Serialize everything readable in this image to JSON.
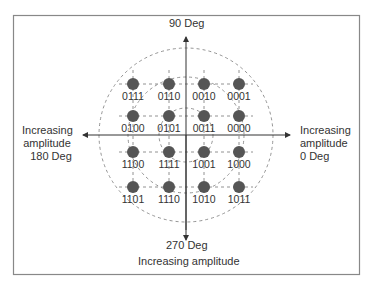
{
  "diagram": {
    "axes": {
      "top_label": "90 Deg",
      "bottom_label_1": "270 Deg",
      "bottom_label_2": "Increasing amplitude",
      "left_label": [
        "Increasing",
        "amplitude",
        "180 Deg"
      ],
      "right_label": [
        "Increasing",
        "amplitude",
        "0 Deg"
      ]
    },
    "points": [
      {
        "code": "0111",
        "x": 133,
        "y": 84
      },
      {
        "code": "0110",
        "x": 169,
        "y": 84
      },
      {
        "code": "0010",
        "x": 204,
        "y": 84
      },
      {
        "code": "0001",
        "x": 239,
        "y": 84
      },
      {
        "code": "0100",
        "x": 133,
        "y": 116
      },
      {
        "code": "0101",
        "x": 169,
        "y": 116
      },
      {
        "code": "0011",
        "x": 204,
        "y": 116
      },
      {
        "code": "0000",
        "x": 239,
        "y": 116
      },
      {
        "code": "1100",
        "x": 133,
        "y": 152
      },
      {
        "code": "1111",
        "x": 169,
        "y": 152
      },
      {
        "code": "1001",
        "x": 204,
        "y": 152
      },
      {
        "code": "1000",
        "x": 239,
        "y": 152
      },
      {
        "code": "1101",
        "x": 133,
        "y": 187
      },
      {
        "code": "1110",
        "x": 169,
        "y": 187
      },
      {
        "code": "1010",
        "x": 204,
        "y": 187
      },
      {
        "code": "1011",
        "x": 239,
        "y": 187
      }
    ],
    "colors": {
      "dot": "#555555",
      "axis": "#333333",
      "dashed": "#777777",
      "frame": "#888888"
    }
  }
}
